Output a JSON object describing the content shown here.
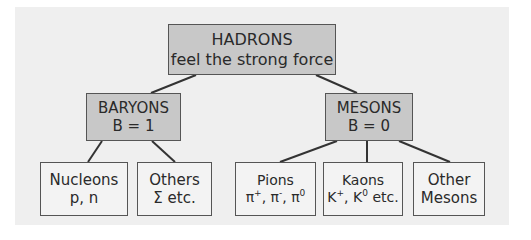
{
  "diagram": {
    "type": "tree",
    "colors": {
      "panel_background": "#efefef",
      "shaded_node": "#c8c8c8",
      "plain_node": "#f3f3f3",
      "border": "#555555",
      "text": "#2a2a2a"
    },
    "root": {
      "id": "hadrons",
      "title": "HADRONS",
      "subtitle": "feel the strong force"
    },
    "level1": [
      {
        "id": "baryons",
        "title": "BARYONS",
        "subtitle": "B = 1",
        "parent": "hadrons"
      },
      {
        "id": "mesons",
        "title": "MESONS",
        "subtitle": "B = 0",
        "parent": "hadrons"
      }
    ],
    "level2": [
      {
        "id": "nucleons",
        "title": "Nucleons",
        "subtitle": "p, n",
        "parent": "baryons"
      },
      {
        "id": "others",
        "title": "Others",
        "subtitle": "Σ etc.",
        "parent": "baryons"
      },
      {
        "id": "pions",
        "title": "Pions",
        "parent": "mesons",
        "particles": [
          {
            "symbol": "π",
            "charge": "+"
          },
          {
            "symbol": "π",
            "charge": "-"
          },
          {
            "symbol": "π",
            "charge": "0"
          }
        ],
        "separator": ", "
      },
      {
        "id": "kaons",
        "title": "Kaons",
        "parent": "mesons",
        "particles": [
          {
            "symbol": "K",
            "charge": "+"
          },
          {
            "symbol": "K",
            "charge": "0"
          }
        ],
        "suffix": "etc."
      },
      {
        "id": "other-mesons",
        "title": "Other",
        "subtitle": "Mesons",
        "parent": "mesons"
      }
    ]
  }
}
